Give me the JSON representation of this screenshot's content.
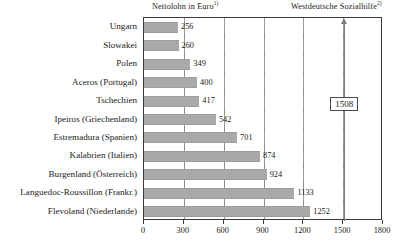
{
  "headers": {
    "left": "Nettolohn in Euro",
    "left_footnote": "1)",
    "right": "Westdeutsche Sozialhilfe",
    "right_footnote": "2)"
  },
  "annotation": {
    "label": "1508",
    "value": 1508,
    "name": "westdeutsche-sozialhilfe-reference"
  },
  "colors": {
    "bar_fill": "#a9a9a9",
    "axis": "#3b3b3b",
    "gridline": "#9a9a9a",
    "arrow": "#7d7d7d",
    "text": "#1a1a1a"
  },
  "chart_data": {
    "type": "bar",
    "orientation": "horizontal",
    "title": "",
    "subtitle": "",
    "xlabel": "Nettolohn in Euro",
    "ylabel": "",
    "xlim": [
      0,
      1800
    ],
    "ylim": null,
    "grid": true,
    "legend": null,
    "xticks": [
      0,
      300,
      600,
      900,
      1200,
      1500,
      1800
    ],
    "xtick_labels": [
      "0",
      "300",
      "600",
      "900",
      "1200",
      "1500",
      "1800"
    ],
    "categories": [
      "Ungarn",
      "Slowakei",
      "Polen",
      "Aceros (Portugal)",
      "Tschechien",
      "Ipeiros (Griechenland)",
      "Estremadura (Spanien)",
      "Kalabrien (Italien)",
      "Burgenland (Österreich)",
      "Languedoc-Roussillon (Frankr.)",
      "Flevoland (Niederlande)"
    ],
    "values": [
      256,
      260,
      349,
      400,
      417,
      542,
      701,
      874,
      924,
      1133,
      1252
    ],
    "value_labels": [
      "256",
      "260",
      "349",
      "400",
      "417",
      "542",
      "701",
      "874",
      "924",
      "1133",
      "1252"
    ],
    "annotations": [
      {
        "text": "1508",
        "value": 1508,
        "kind": "vertical-arrow-with-boxed-label",
        "label_top": "Westdeutsche Sozialhilfe"
      }
    ]
  }
}
